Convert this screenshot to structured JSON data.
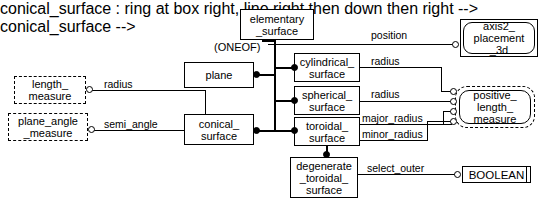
{
  "diagram": {
    "notation": "EXPRESS-G",
    "supertype_constraint": "(ONEOF)"
  },
  "entities": {
    "elementary_surface": "elementary\n_surface",
    "plane": "plane",
    "conical_surface": "conical_\nsurface",
    "cylindrical_surface": "cylindrical_\nsurface",
    "spherical_surface": "spherical_\nsurface",
    "toroidal_surface": "toroidal_\nsurface",
    "degenerate_toroidal_surface": "degenerate\n_toroidal_\nsurface"
  },
  "types": {
    "length_measure": "length_\nmeasure",
    "plane_angle_measure": "plane_angle\n_measure",
    "axis2_placement_3d": "axis2_\nplacement\n_3d",
    "positive_length_measure": "positive_\nlength_\nmeasure",
    "boolean": "BOOLEAN"
  },
  "attributes": {
    "position": "position",
    "radius_cylindrical": "radius",
    "radius_spherical": "radius",
    "radius_conical": "radius",
    "semi_angle": "semi_angle",
    "major_radius": "major_radius",
    "minor_radius": "minor_radius",
    "select_outer": "select_outer"
  },
  "colors": {
    "stroke": "#000000",
    "background": "#ffffff"
  }
}
